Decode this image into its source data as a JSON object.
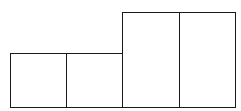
{
  "diagram": {
    "type": "rectangle-arrangement",
    "stroke_color": "#1a1a1a",
    "background": "#ffffff",
    "rectangles": [
      {
        "id": "short-1",
        "x": 10,
        "y": 53,
        "w": 57,
        "h": 55
      },
      {
        "id": "short-2",
        "x": 66,
        "y": 53,
        "w": 57,
        "h": 55
      },
      {
        "id": "tall-1",
        "x": 122,
        "y": 12,
        "w": 58,
        "h": 96
      },
      {
        "id": "tall-2",
        "x": 179,
        "y": 12,
        "w": 57,
        "h": 96
      }
    ]
  }
}
